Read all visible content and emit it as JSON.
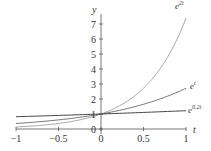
{
  "chart_data": {
    "type": "line",
    "title": "",
    "xlabel": "t",
    "ylabel": "y",
    "xlim": [
      -1,
      1
    ],
    "ylim": [
      0,
      7.5
    ],
    "grid": false,
    "legend": "inline labels at right end of curves",
    "x_ticks": [
      -1,
      -0.5,
      0,
      0.5,
      1
    ],
    "x_tick_labels": [
      "−1",
      "−0.5",
      "0",
      "0.5",
      "1"
    ],
    "y_ticks": [
      0,
      1,
      2,
      3,
      4,
      5,
      6,
      7
    ],
    "y_tick_labels": [
      "0",
      "1",
      "2",
      "3",
      "4",
      "5",
      "6",
      "7"
    ],
    "x": [
      -1,
      -0.75,
      -0.5,
      -0.25,
      0,
      0.25,
      0.5,
      0.75,
      1
    ],
    "series": [
      {
        "name": "e^{2t}",
        "label_base": "e",
        "label_exp": "2t",
        "color": "#aaaaaa",
        "values": [
          0.135,
          0.223,
          0.368,
          0.607,
          1.0,
          1.649,
          2.718,
          4.482,
          7.389
        ]
      },
      {
        "name": "e^{t}",
        "label_base": "e",
        "label_exp": "t",
        "color": "#777777",
        "values": [
          0.368,
          0.472,
          0.607,
          0.779,
          1.0,
          1.284,
          1.649,
          2.117,
          2.718
        ]
      },
      {
        "name": "e^{0.2t}",
        "label_base": "e",
        "label_exp": "0.2t",
        "color": "#444444",
        "values": [
          0.819,
          0.861,
          0.905,
          0.951,
          1.0,
          1.051,
          1.105,
          1.162,
          1.221
        ]
      }
    ]
  }
}
